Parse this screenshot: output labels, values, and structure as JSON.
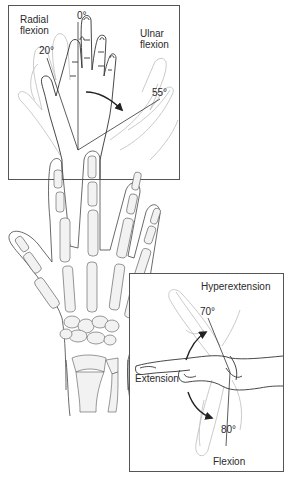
{
  "figure": {
    "top_panel": {
      "name": "Radial and ulnar flexion",
      "labels": {
        "radial": "Radial\nflexion",
        "ulnar": "Ulnar\nflexion",
        "neutral_angle": "0°",
        "radial_angle": "20°",
        "ulnar_angle": "55°"
      }
    },
    "bottom_panel": {
      "name": "Extension, hyperextension and flexion",
      "labels": {
        "hyperextension": "Hyperextension",
        "extension": "Extension",
        "flexion": "Flexion",
        "hyperextension_angle": "70°",
        "flexion_angle": "80°"
      }
    },
    "center": {
      "name": "Skeletal hand (dorsal view)"
    },
    "colors": {
      "line": "#3a3a3a",
      "ghost": "#bdbdbd",
      "bone_fill": "#f0f0f0",
      "border": "#555555"
    }
  }
}
